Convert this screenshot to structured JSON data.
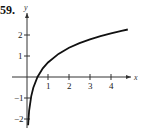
{
  "problem_number": "59.",
  "chart_data": {
    "type": "line",
    "title": "",
    "xlabel": "x",
    "ylabel": "y",
    "xlim": [
      -0.3,
      5
    ],
    "ylim": [
      -2.4,
      2.7
    ],
    "x_ticks": [
      1,
      2,
      3,
      4
    ],
    "y_ticks": [
      -2,
      -1,
      1,
      2
    ],
    "grid": false,
    "series": [
      {
        "name": "f(x)",
        "x": [
          0.05,
          0.1,
          0.2,
          0.3,
          0.5,
          0.75,
          1,
          1.5,
          2,
          2.5,
          3,
          3.5,
          4,
          4.5,
          4.8
        ],
        "values": [
          -2.3,
          -1.61,
          -0.92,
          -0.51,
          0.0,
          0.41,
          0.69,
          1.1,
          1.39,
          1.61,
          1.79,
          1.95,
          2.08,
          2.2,
          2.26
        ]
      }
    ]
  }
}
